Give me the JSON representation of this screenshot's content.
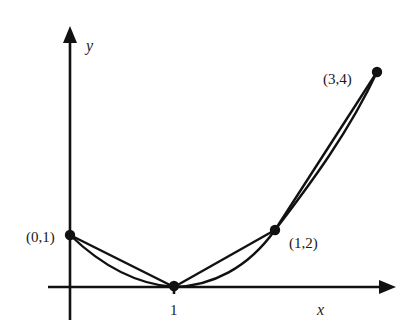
{
  "figure": {
    "axes": {
      "x_label": "x",
      "y_label": "y",
      "x_tick_label": "1"
    },
    "points": [
      {
        "label": "(0,1)"
      },
      {
        "label": ""
      },
      {
        "label": "(1,2)"
      },
      {
        "label": "(3,4)"
      }
    ],
    "colors": {
      "ink": "#111111",
      "background": "#ffffff"
    }
  }
}
